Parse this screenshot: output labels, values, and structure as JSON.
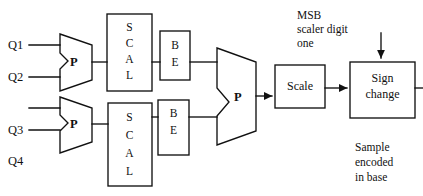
{
  "diagram": {
    "inputs": [
      {
        "label": "Q1"
      },
      {
        "label": "Q2"
      },
      {
        "label": "Q3"
      },
      {
        "label": "Q4"
      }
    ],
    "muxes": [
      {
        "name": "upper-mux",
        "label": "P"
      },
      {
        "name": "lower-mux",
        "label": "P"
      },
      {
        "name": "main-mux",
        "label": "P"
      }
    ],
    "scal_blocks": [
      {
        "name": "upper-scal",
        "letters": [
          "S",
          "C",
          "A",
          "L"
        ]
      },
      {
        "name": "lower-scal",
        "letters": [
          "S",
          "C",
          "A",
          "L"
        ]
      }
    ],
    "be_blocks": [
      {
        "name": "upper-be",
        "letters": [
          "B",
          "E"
        ]
      },
      {
        "name": "lower-be",
        "letters": [
          "B",
          "E"
        ]
      }
    ],
    "scale_block": {
      "label": "Scale"
    },
    "sign_change_block": {
      "line1": "Sign",
      "line2": "change"
    },
    "annotations": {
      "msb": {
        "line1": "MSB",
        "line2": "scaler digit",
        "line3": "one"
      },
      "sample": {
        "line1": "Sample",
        "line2": "encoded",
        "line3": "in base"
      }
    },
    "colors": {
      "stroke": "#111111",
      "text": "#111111",
      "background": "#ffffff"
    }
  }
}
